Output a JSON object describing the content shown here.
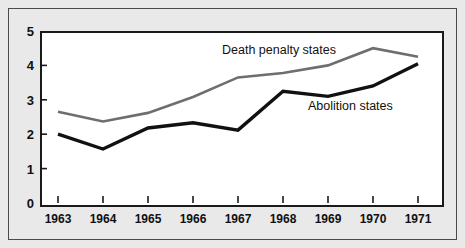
{
  "chart_data": {
    "type": "line",
    "title": "",
    "xlabel": "",
    "ylabel": "",
    "x": [
      "1963",
      "1964",
      "1965",
      "1966",
      "1967",
      "1968",
      "1969",
      "1970",
      "1971"
    ],
    "categories": [
      "1963",
      "1964",
      "1965",
      "1966",
      "1967",
      "1968",
      "1969",
      "1970",
      "1971"
    ],
    "xlim": [
      "1963",
      "1971"
    ],
    "ylim": [
      0,
      5
    ],
    "yticks": [
      0,
      1,
      2,
      3,
      4,
      5
    ],
    "ytick_labels": [
      "0",
      "1",
      "2",
      "3",
      "4",
      "5"
    ],
    "grid": false,
    "legend_position": "inline-annotations",
    "series": [
      {
        "name": "Death penalty states",
        "color": "#6e6e6e",
        "line_width": 2.6,
        "values": [
          2.65,
          2.37,
          2.62,
          3.08,
          3.65,
          3.78,
          4.0,
          4.5,
          4.25
        ]
      },
      {
        "name": "Abolition states",
        "color": "#111111",
        "line_width": 3.4,
        "values": [
          2.0,
          1.57,
          2.18,
          2.33,
          2.12,
          3.25,
          3.1,
          3.4,
          4.05
        ]
      }
    ],
    "annotations": [
      {
        "text": "Death penalty states",
        "series": "Death penalty states"
      },
      {
        "text": "Abolition states",
        "series": "Abolition states"
      }
    ]
  },
  "axes": {
    "y_labels": [
      "5",
      "4",
      "3",
      "2",
      "1",
      "0"
    ],
    "x_labels": [
      "1963",
      "1964",
      "1965",
      "1966",
      "1967",
      "1968",
      "1969",
      "1970",
      "1971"
    ]
  },
  "colors": {
    "page_background": "#e9e9e9",
    "plot_background": "#ffffff",
    "axis": "#1a1a1a",
    "frame": "#4a4a4a",
    "death_penalty_line": "#6e6e6e",
    "abolition_line": "#111111",
    "text": "#101010"
  }
}
